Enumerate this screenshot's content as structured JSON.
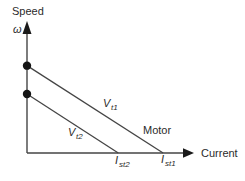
{
  "figure": {
    "type": "schematic-plot",
    "colors": {
      "background": "#ffffff",
      "axis": "#454545",
      "curve": "#454545",
      "marker": "#141414",
      "text": "#2b2b2b"
    },
    "labels": {
      "speed": "Speed",
      "omega": "ω",
      "current": "Current",
      "motor": "Motor",
      "vt1_main": "V",
      "vt1_sub": "t1",
      "vt2_main": "V",
      "vt2_sub": "t2",
      "ist2_main": "I",
      "ist2_sub": "st2",
      "ist1_main": "I",
      "ist1_sub": "st1"
    }
  },
  "chart_data": {
    "type": "line",
    "title": "",
    "xlabel": "Current",
    "ylabel": "Speed (ω)",
    "axes_units": "arbitrary (unlabeled schematic, values estimated from pixel positions, axis length = 1)",
    "x_range": [
      0,
      1
    ],
    "y_range": [
      0,
      1
    ],
    "grid": false,
    "legend": "none",
    "series": [
      {
        "name": "Vt1",
        "label": "V_t1",
        "points": [
          [
            0,
            0.71
          ],
          [
            0.82,
            0
          ]
        ]
      },
      {
        "name": "Vt2",
        "label": "V_t2",
        "points": [
          [
            0,
            0.48
          ],
          [
            0.55,
            0
          ]
        ]
      }
    ],
    "y_axis_markers": [
      {
        "y": 0.71,
        "marker": "filled-dot",
        "meaning": "no-load speed for V_t1"
      },
      {
        "y": 0.48,
        "marker": "filled-dot",
        "meaning": "no-load speed for V_t2"
      }
    ],
    "x_axis_intercept_labels": [
      {
        "x": 0.55,
        "label": "I_st2"
      },
      {
        "x": 0.82,
        "label": "I_st1"
      }
    ],
    "annotations": [
      {
        "text": "Motor",
        "x": 0.75,
        "y": 0.16,
        "note": "region label above V_t1 line"
      }
    ]
  }
}
